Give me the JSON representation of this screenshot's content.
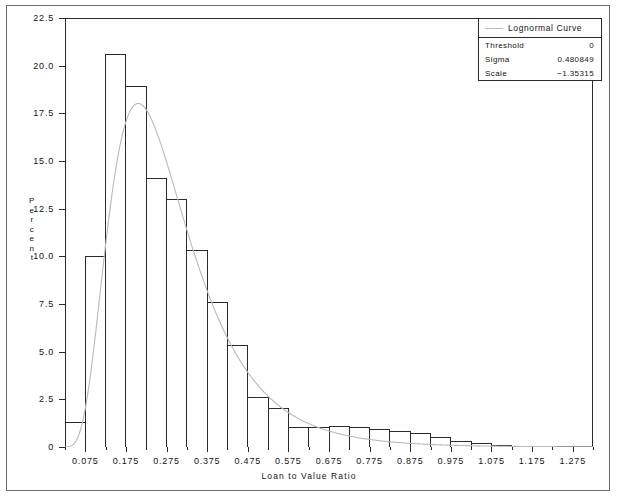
{
  "chart_data": {
    "type": "bar",
    "title": "",
    "xlabel": "Loan to Value Ratio",
    "ylabel": "Percent",
    "xlim": [
      0.025,
      1.325
    ],
    "ylim": [
      0,
      22.5
    ],
    "bin_width": 0.05,
    "grid": false,
    "xticks": [
      0.075,
      0.175,
      0.275,
      0.375,
      0.475,
      0.575,
      0.675,
      0.775,
      0.875,
      0.975,
      1.075,
      1.175,
      1.275
    ],
    "xtick_labels": [
      "0.075",
      "0.175",
      "0.275",
      "0.375",
      "0.475",
      "0.575",
      "0.675",
      "0.775",
      "0.875",
      "0.975",
      "1.075",
      "1.175",
      "1.275"
    ],
    "yticks": [
      0,
      2.5,
      5.0,
      7.5,
      10.0,
      12.5,
      15.0,
      17.5,
      20.0,
      22.5
    ],
    "ytick_labels": [
      "0",
      "2.5",
      "5.0",
      "7.5",
      "10.0",
      "12.5",
      "15.0",
      "17.5",
      "20.0",
      "22.5"
    ],
    "bin_centers": [
      0.05,
      0.1,
      0.15,
      0.2,
      0.25,
      0.3,
      0.35,
      0.4,
      0.45,
      0.5,
      0.55,
      0.6,
      0.65,
      0.7,
      0.75,
      0.8,
      0.85,
      0.9,
      0.95,
      1.0,
      1.05,
      1.1,
      1.15,
      1.2,
      1.25,
      1.3
    ],
    "values": [
      1.3,
      10.0,
      20.6,
      18.9,
      14.1,
      13.0,
      10.3,
      7.6,
      5.3,
      2.6,
      2.0,
      1.0,
      1.0,
      1.1,
      1.0,
      0.9,
      0.8,
      0.7,
      0.5,
      0.3,
      0.2,
      0.1,
      0.05,
      0.05,
      0.0,
      0.0
    ],
    "series": [
      {
        "name": "Lognormal Curve",
        "type": "line",
        "color": "#b9b9b9",
        "distribution": "lognormal",
        "threshold": 0,
        "sigma": 0.480849,
        "scale": -1.35315,
        "bin_width": 0.05,
        "peak_value": 18.3,
        "peak_x": 0.21
      }
    ]
  },
  "legend": {
    "title": "Lognormal Curve",
    "rows": [
      {
        "key": "Threshold",
        "value": "0"
      },
      {
        "key": "Sigma",
        "value": "0.480849"
      },
      {
        "key": "Scale",
        "value": "−1.35315"
      }
    ]
  },
  "axes": {
    "y_title": "Percent",
    "x_title": "Loan to Value Ratio"
  },
  "colors": {
    "bar_outline": "#2a2a2a",
    "bar_fill": "#ffffff",
    "curve": "#b9b9b9",
    "axis": "#2a2a2a",
    "frame": "#6b6b6b",
    "text": "#141414",
    "background": "#ffffff"
  }
}
